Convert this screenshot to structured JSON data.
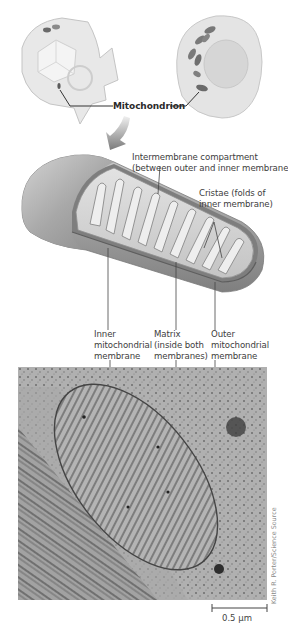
{
  "figure": {
    "top_illustrations": {
      "left_cell": "plant-cell-cutaway",
      "right_cell": "animal-cell-cutaway",
      "callout_label": "Mitochondrion"
    },
    "arrow": "curved-down-arrow",
    "mitochondrion_labels": {
      "intermembrane_line1": "Intermembrane compartment",
      "intermembrane_line2": "(between outer and inner membranes)",
      "cristae_line1": "Cristae (folds of",
      "cristae_line2": "inner membrane)",
      "inner_line1": "Inner",
      "inner_line2": "mitochondrial",
      "inner_line3": "membrane",
      "matrix_line1": "Matrix",
      "matrix_line2": "(inside both",
      "matrix_line3": "membranes)",
      "outer_line1": "Outer",
      "outer_line2": "mitochondrial",
      "outer_line3": "membrane"
    },
    "micrograph": {
      "credit": "Keith R. Porter/Science Source",
      "scale_bar_label": "0.5 µm"
    },
    "colors": {
      "membrane_gray": "#9c9c9c",
      "cell_fill": "#e6e6e6",
      "organelle_dark": "#6a6a6a",
      "micrograph_bg": "#9a9a9a",
      "arrow": "#7d7d7d"
    }
  }
}
